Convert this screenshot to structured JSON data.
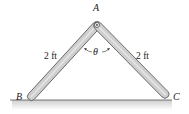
{
  "figure": {
    "points": {
      "A": {
        "label": "A",
        "x": 97,
        "y": 25
      },
      "B": {
        "label": "B",
        "x": 31,
        "y": 97
      },
      "C": {
        "label": "C",
        "x": 164,
        "y": 97
      }
    },
    "bars": [
      {
        "name": "AB",
        "length_label": "2 ft"
      },
      {
        "name": "AC",
        "length_label": "2 ft"
      }
    ],
    "angle_label": "θ",
    "colors": {
      "bar_fill": "#c9c9c9",
      "bar_edge": "#555555",
      "ground_line": "#555555",
      "ground_fill": "#d9d9d9"
    }
  }
}
